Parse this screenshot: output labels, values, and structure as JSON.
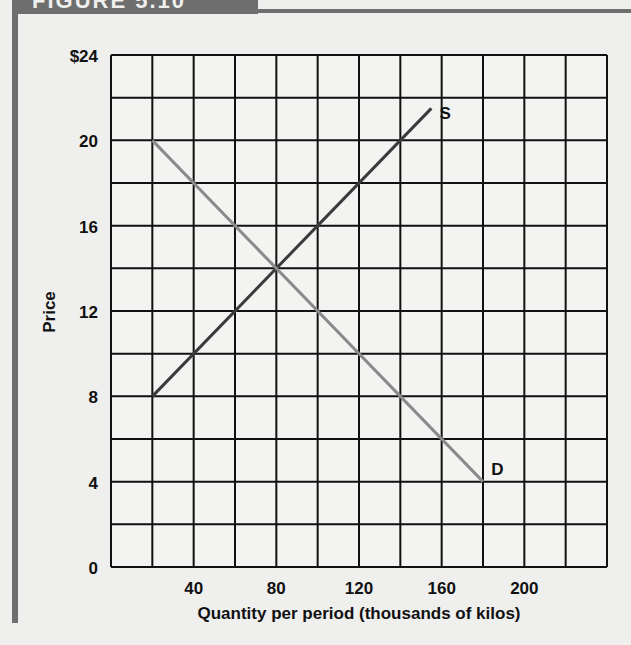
{
  "header": {
    "title": "FIGURE 5.10"
  },
  "chart_data": {
    "type": "line",
    "title": "",
    "xlabel": "Quantity per period (thousands of kilos)",
    "ylabel": "Price",
    "xlim": [
      0,
      240
    ],
    "ylim": [
      0,
      24
    ],
    "x_ticks": [
      40,
      80,
      120,
      160,
      200
    ],
    "y_ticks": [
      "0",
      "4",
      "8",
      "12",
      "16",
      "20",
      "$24"
    ],
    "grid": true,
    "grid_x_step": 20,
    "grid_y_step": 2,
    "series": [
      {
        "name": "S",
        "label": "S",
        "color": "#3a3a3a",
        "points": [
          [
            20,
            8
          ],
          [
            155,
            21.5
          ]
        ]
      },
      {
        "name": "D",
        "label": "D",
        "color": "#8a8a8a",
        "points": [
          [
            20,
            20
          ],
          [
            180,
            4
          ]
        ]
      }
    ],
    "annotations": [
      {
        "text": "S",
        "x": 159,
        "y": 21.3
      },
      {
        "text": "D",
        "x": 184,
        "y": 4.6
      }
    ]
  }
}
